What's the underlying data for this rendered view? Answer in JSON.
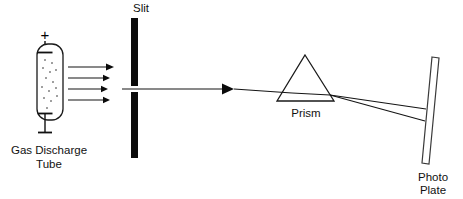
{
  "diagram": {
    "background_color": "#ffffff",
    "ink_color": "#111111",
    "labels": {
      "gas_discharge_tube_line1": "Gas Discharge",
      "gas_discharge_tube_line2": "Tube",
      "slit": "Slit",
      "prism": "Prism",
      "photo_plate_line1": "Photo",
      "photo_plate_line2": "Plate",
      "anode_sign": "+",
      "cathode_sign": "—"
    },
    "components": {
      "gas_discharge_tube": {
        "name": "Gas Discharge Tube",
        "shape": "vertical capsule",
        "x": 37,
        "y": 44,
        "width": 26,
        "height": 76,
        "gas_dot_count": 14,
        "electrodes": [
          "top anode (+)",
          "bottom cathode (—)"
        ]
      },
      "emission_arrows": {
        "name": "Light emission arrows",
        "count": 4,
        "direction": "right",
        "x_start": 68,
        "x_end": 113,
        "y_values": [
          67,
          78,
          89,
          100
        ]
      },
      "slit": {
        "name": "Slit",
        "shape": "two vertical black bars with central gap",
        "bar_x": 131,
        "bar_width": 7,
        "upper_bar_y": [
          18,
          86
        ],
        "lower_bar_y": [
          92,
          158
        ],
        "gap_center_y": 89
      },
      "collimated_beam": {
        "name": "Collimated beam arrow",
        "x_start": 138,
        "x_end": 232,
        "y": 89,
        "arrowhead": true
      },
      "prism": {
        "name": "Prism",
        "shape": "triangle",
        "apex": [
          305,
          55
        ],
        "base_left": [
          277,
          101
        ],
        "base_right": [
          334,
          101
        ]
      },
      "dispersed_rays": {
        "name": "Dispersed rays",
        "count": 2,
        "exit_point": [
          330,
          95
        ],
        "plate_hit_y": [
          109,
          121
        ]
      },
      "photo_plate": {
        "name": "Photo Plate",
        "shape": "thin tilted rectangle",
        "top": [
          432,
          57
        ],
        "bottom": [
          422,
          163
        ],
        "thickness": 7
      }
    }
  }
}
